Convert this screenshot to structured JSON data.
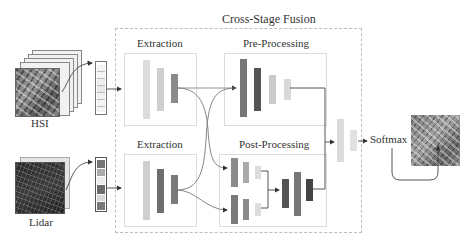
{
  "diagram": {
    "title": "Cross-Stage Fusion",
    "inputs": {
      "hsi_label": "HSI",
      "lidar_label": "Lidar"
    },
    "modules": {
      "extraction_top": "Extraction",
      "extraction_bottom": "Extraction",
      "pre_processing": "Pre-Processing",
      "post_processing": "Post-Processing"
    },
    "output": {
      "softmax_label": "Softmax"
    },
    "colors": {
      "light_bar": "#d6d6d6",
      "mid_bar": "#8a8a8a",
      "dark_bar": "#555555",
      "dashed_border": "#bdbdbd",
      "box_border": "#dcdcdc",
      "arrow": "#444444"
    }
  }
}
